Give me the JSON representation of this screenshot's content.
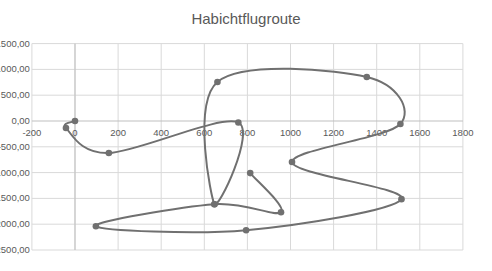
{
  "chart_data": {
    "type": "scatter",
    "style": "smooth-line-with-markers",
    "title": "Habichtflugroute",
    "xlabel": "",
    "ylabel": "",
    "xlim": [
      -200,
      1800
    ],
    "ylim": [
      -2500,
      1500
    ],
    "x_ticks": [
      -200,
      0,
      200,
      400,
      600,
      800,
      1000,
      1200,
      1400,
      1600,
      1800
    ],
    "x_tick_labels": [
      "-200",
      "0",
      "200",
      "400",
      "600",
      "800",
      "1000",
      "1200",
      "1400",
      "1600",
      "1800"
    ],
    "y_ticks": [
      1500,
      1000,
      500,
      0,
      -500,
      -1000,
      -1500,
      -2000,
      -2500
    ],
    "y_tick_labels": [
      "1500,00",
      "1000,00",
      "500,00",
      "0,00",
      "-500,00",
      "-1000,00",
      "-1500,00",
      "-2000,00",
      "-2500,00"
    ],
    "grid": true,
    "legend": null,
    "series": [
      {
        "name": "Habichtflugroute",
        "color": "#707070",
        "points": [
          {
            "x": 0,
            "y": 0
          },
          {
            "x": -42,
            "y": -136
          },
          {
            "x": 157,
            "y": -621
          },
          {
            "x": 758,
            "y": -30
          },
          {
            "x": 647,
            "y": -1612
          },
          {
            "x": 661,
            "y": 757
          },
          {
            "x": 1354,
            "y": 854
          },
          {
            "x": 1510,
            "y": -58
          },
          {
            "x": 1007,
            "y": -796
          },
          {
            "x": 1515,
            "y": -1515
          },
          {
            "x": 794,
            "y": -2117
          },
          {
            "x": 97,
            "y": -2039
          },
          {
            "x": 647,
            "y": -1612
          },
          {
            "x": 956,
            "y": -1767
          },
          {
            "x": 813,
            "y": -1010
          }
        ]
      }
    ]
  },
  "colors": {
    "grid": "#d9d9d9",
    "axis": "#bfbfbf",
    "line": "#707070",
    "text": "#595959"
  }
}
